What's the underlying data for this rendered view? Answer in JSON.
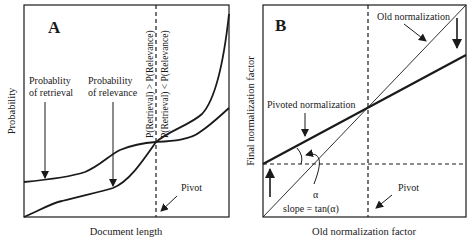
{
  "panel_a": {
    "letter": "A",
    "xlabel": "Document length",
    "ylabel": "Probability",
    "retrieval_label_line1": "Probablity",
    "retrieval_label_line2": "of retrieval",
    "relevance_label_line1": "Probability",
    "relevance_label_line2": "of relevance",
    "vertical_label_left": "P(Retrieval) > P(Relevance)",
    "vertical_label_right": "P(Retrieval) < P(Relevance)",
    "pivot_label": "Pivot"
  },
  "panel_b": {
    "letter": "B",
    "xlabel": "Old normalization factor",
    "ylabel": "Final normalization factor",
    "old_norm_label": "Old normalization",
    "pivoted_norm_label": "Pivoted normalization",
    "alpha_label": "α",
    "slope_label": "slope = tan(α)",
    "pivot_label": "Pivot"
  },
  "colors": {
    "ink": "#1a1a1a",
    "background": "#ffffff"
  }
}
